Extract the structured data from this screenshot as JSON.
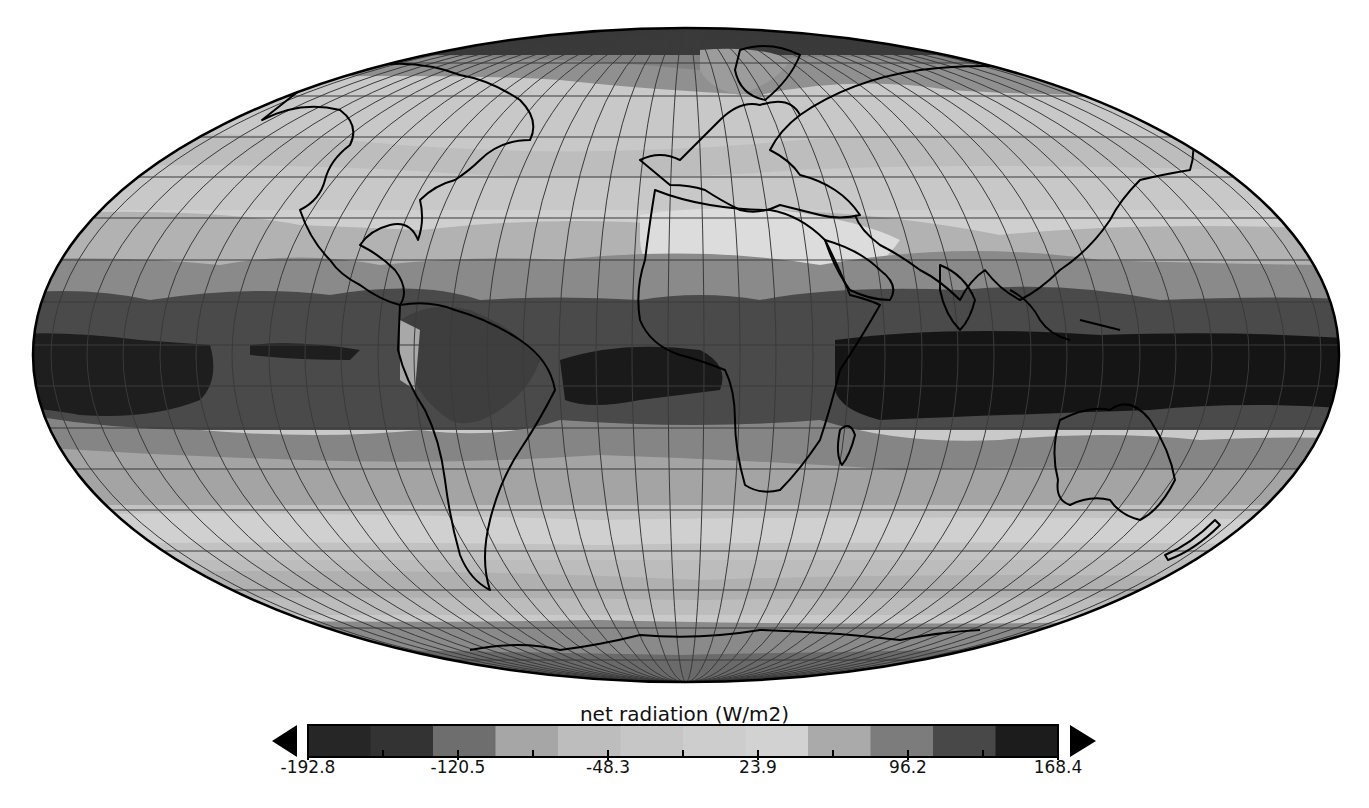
{
  "chart_data": {
    "type": "heatmap",
    "subtype": "global map (Mollweide projection)",
    "title": "net radiation (W/m2)",
    "variable": "net radiation",
    "units": "W/m2",
    "colorbar": {
      "label": "net radiation (W/m2)",
      "min": -192.8,
      "max": 168.4,
      "tick_labels": [
        "-192.8",
        "-120.5",
        "-48.3",
        "23.9",
        "96.2",
        "168.4"
      ],
      "tick_values": [
        -192.8,
        -120.5,
        -48.3,
        23.9,
        96.2,
        168.4
      ],
      "n_bins": 12,
      "extend": "both",
      "bin_colors": [
        "#262626",
        "#333333",
        "#6e6e6e",
        "#a6a6a6",
        "#bdbdbd",
        "#c6c6c6",
        "#cdcdcd",
        "#d2d2d2",
        "#aaaaaa",
        "#7c7c7c",
        "#484848",
        "#1c1c1c"
      ]
    },
    "latitude_bands_approx": [
      {
        "region": "Arctic / north pole",
        "level": "strongly negative (dark)"
      },
      {
        "region": "northern mid-latitudes (40-70N)",
        "level": "near zero / slightly negative (light gray)"
      },
      {
        "region": "subtropics north (20-35N)",
        "level": "slightly positive (light-medium gray)"
      },
      {
        "region": "tropics (0-20N/S)",
        "level": "strongly positive (dark to black), max over W Pacific & Indian Ocean"
      },
      {
        "region": "southern subtropics (20-35S)",
        "level": "moderately positive (medium gray)"
      },
      {
        "region": "southern mid-latitudes (40-60S)",
        "level": "near zero (light gray)"
      },
      {
        "region": "Antarctica",
        "level": "negative (medium-dark gray)"
      }
    ],
    "grid": true,
    "coastlines": true
  },
  "map": {
    "projection": "Mollweide",
    "graticule": "10-degree latitude/longitude lines"
  },
  "colorbar": {
    "title": "net radiation (W/m2)",
    "ticks": [
      "-192.8",
      "-120.5",
      "-48.3",
      "23.9",
      "96.2",
      "168.4"
    ]
  }
}
